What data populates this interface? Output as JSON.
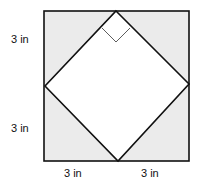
{
  "diagram": {
    "type": "square-inscribed-diamond",
    "labels": {
      "left_top": "3 in",
      "left_bottom": "3 in",
      "bottom_left": "3 in",
      "bottom_right": "3 in"
    },
    "colors": {
      "shaded": "#ebebeb",
      "inner": "#ffffff",
      "stroke": "#111111"
    },
    "right_angle_marker": true
  }
}
